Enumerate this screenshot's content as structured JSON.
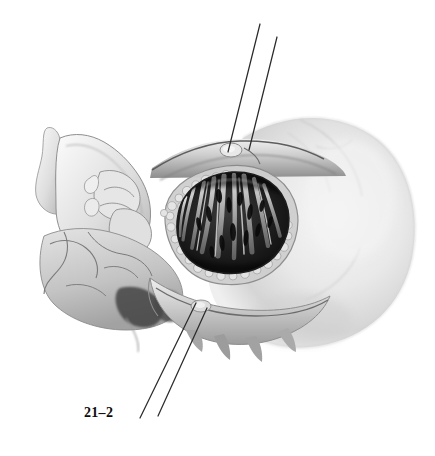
{
  "figure": {
    "label": "21–2",
    "label_position": {
      "x": 84,
      "y": 405
    },
    "caption_present": false,
    "medium": "grayscale airbrush / stipple medical illustration"
  },
  "canvas": {
    "width": 435,
    "height": 456,
    "background": "#ffffff"
  },
  "palette": {
    "paper": "#ffffff",
    "lightest_tissue": "#f2f2f2",
    "light_tissue": "#dcdcdc",
    "mid_tissue": "#c0c0c0",
    "mid_dark_tissue": "#9a9a9a",
    "shadow": "#6e6e6e",
    "deep_shadow": "#3c3c3c",
    "cavity_dark": "#1c1c1c",
    "cavity_darkest": "#0e0e0e",
    "strand_highlight": "#e6e6e6",
    "outline": "#2a2a2a",
    "suture_line": "#2b2b2b",
    "label_ink": "#0c0c0c"
  },
  "suture_lines": [
    {
      "name": "upper-suture-strand-a",
      "x1": 260,
      "y1": 24,
      "x2": 228,
      "y2": 152
    },
    {
      "name": "upper-suture-strand-b",
      "x1": 277,
      "y1": 37,
      "x2": 249,
      "y2": 150
    },
    {
      "name": "lower-suture-strand-a",
      "x1": 196,
      "y1": 303,
      "x2": 140,
      "y2": 418
    },
    {
      "name": "lower-suture-strand-b",
      "x1": 207,
      "y1": 308,
      "x2": 158,
      "y2": 416
    }
  ],
  "regions": [
    {
      "name": "nasal-dorsum-and-bone",
      "note": "pale bony nasal dorsum at far left, x 28-90, y 125-210"
    },
    {
      "name": "turbinate-stack",
      "note": "scroll-like inferior and middle turbinates, x 70-150, y 170-245"
    },
    {
      "name": "nasal-floor-and-palate",
      "note": "textured bone with fissures, x 40-175, y 225-330"
    },
    {
      "name": "surgical-window-cavity",
      "note": "dark oval opening with radiating pale strands, x 170-290, y 172-272"
    },
    {
      "name": "granular-bone-margin",
      "note": "cobblestone bone chips lining cavity rim"
    },
    {
      "name": "cheek-soft-tissue-mass",
      "note": "large pale rounded soft-tissue mass, right half, x 260-420, y 110-345"
    },
    {
      "name": "mucosal-flap-upper-ridge",
      "note": "horizontal ridge pierced by the upper sutures, y 140-165"
    },
    {
      "name": "mucosal-flap-lower-edge",
      "note": "jagged inferior margin with pointed projections, y 290-350"
    }
  ]
}
